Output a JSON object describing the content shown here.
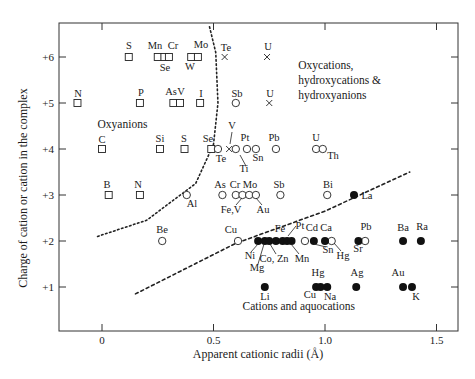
{
  "chart_data": {
    "type": "scatter",
    "title": "",
    "xlabel": "Apparent cationic radii (Å)",
    "ylabel": "Charge of cation or cation in the complex",
    "xlim": [
      -0.18,
      1.6
    ],
    "ylim": [
      0.25,
      6.7
    ],
    "x_ticks": [
      0,
      0.5,
      1.0,
      1.5
    ],
    "x_tick_labels": [
      "0",
      "0.5",
      "1.0",
      "1.5"
    ],
    "y_ticks": [
      1,
      2,
      3,
      4,
      5,
      6
    ],
    "y_tick_labels": [
      "+1",
      "+2",
      "+3",
      "+4",
      "+5",
      "+6"
    ],
    "grid": false,
    "legend": null,
    "marker_legend": {
      "square": "oxyanion",
      "cross": "oxycation",
      "open_circle": "hydroxy complex",
      "filled_circle": "cation / aquocation"
    },
    "region_labels": [
      {
        "text": "Oxyanions",
        "x": -0.02,
        "y": 4.45
      },
      {
        "text": "Oxycations,",
        "x": 0.88,
        "y": 5.75
      },
      {
        "text": "hydroxycations &",
        "x": 0.88,
        "y": 5.42
      },
      {
        "text": "hydroxyanions",
        "x": 0.88,
        "y": 5.09
      },
      {
        "text": "Cations and aquocations",
        "x": 0.63,
        "y": 0.5
      }
    ],
    "boundaries": [
      {
        "name": "oxyanion-boundary",
        "style": "dotted",
        "points": [
          [
            -0.02,
            2.1
          ],
          [
            0.2,
            2.45
          ],
          [
            0.42,
            3.25
          ],
          [
            0.5,
            4.1
          ],
          [
            0.52,
            5.0
          ],
          [
            0.51,
            6.1
          ],
          [
            0.48,
            6.7
          ]
        ]
      },
      {
        "name": "cation-boundary",
        "style": "dashed",
        "points": [
          [
            0.15,
            0.85
          ],
          [
            0.6,
            1.95
          ],
          [
            1.0,
            2.65
          ],
          [
            1.38,
            3.5
          ]
        ]
      }
    ],
    "series": [
      {
        "name": "Oxyanions",
        "marker": "square",
        "points": [
          {
            "label": "S",
            "x": 0.12,
            "y": 6
          },
          {
            "label": "Mn",
            "x": 0.25,
            "y": 6
          },
          {
            "label": "Se",
            "x": 0.28,
            "y": 6
          },
          {
            "label": "Cr",
            "x": 0.3,
            "y": 6
          },
          {
            "label": "W",
            "x": 0.4,
            "y": 6
          },
          {
            "label": "Mo",
            "x": 0.43,
            "y": 6
          },
          {
            "label": "N",
            "x": -0.11,
            "y": 5
          },
          {
            "label": "P",
            "x": 0.17,
            "y": 5
          },
          {
            "label": "As",
            "x": 0.32,
            "y": 5
          },
          {
            "label": "V",
            "x": 0.35,
            "y": 5
          },
          {
            "label": "I",
            "x": 0.44,
            "y": 5
          },
          {
            "label": "C",
            "x": 0.0,
            "y": 4
          },
          {
            "label": "Si",
            "x": 0.26,
            "y": 4
          },
          {
            "label": "S",
            "x": 0.37,
            "y": 4
          },
          {
            "label": "Se",
            "x": 0.49,
            "y": 4
          },
          {
            "label": "B",
            "x": 0.03,
            "y": 3
          },
          {
            "label": "N",
            "x": 0.17,
            "y": 3
          }
        ]
      },
      {
        "name": "Oxycations",
        "marker": "cross",
        "points": [
          {
            "label": "Te",
            "x": 0.55,
            "y": 6
          },
          {
            "label": "U",
            "x": 0.74,
            "y": 6
          },
          {
            "label": "U",
            "x": 0.75,
            "y": 5
          },
          {
            "label": "V",
            "x": 0.57,
            "y": 4
          }
        ]
      },
      {
        "name": "Hydroxy complexes",
        "marker": "open_circle",
        "points": [
          {
            "label": "Sb",
            "x": 0.6,
            "y": 5
          },
          {
            "label": "Te",
            "x": 0.52,
            "y": 4
          },
          {
            "label": "Ti",
            "x": 0.6,
            "y": 4
          },
          {
            "label": "Pt",
            "x": 0.65,
            "y": 4
          },
          {
            "label": "Sn",
            "x": 0.69,
            "y": 4
          },
          {
            "label": "Pb",
            "x": 0.78,
            "y": 4
          },
          {
            "label": "U",
            "x": 0.96,
            "y": 4
          },
          {
            "label": "Th",
            "x": 0.99,
            "y": 4
          },
          {
            "label": "Al",
            "x": 0.38,
            "y": 3
          },
          {
            "label": "As",
            "x": 0.54,
            "y": 3
          },
          {
            "label": "Cr",
            "x": 0.6,
            "y": 3
          },
          {
            "label": "Fe,V",
            "x": 0.63,
            "y": 3
          },
          {
            "label": "Mo",
            "x": 0.66,
            "y": 3
          },
          {
            "label": "Au",
            "x": 0.69,
            "y": 3
          },
          {
            "label": "Sb",
            "x": 0.8,
            "y": 3
          },
          {
            "label": "Bi",
            "x": 1.01,
            "y": 3
          },
          {
            "label": "Be",
            "x": 0.27,
            "y": 2
          },
          {
            "label": "Cu",
            "x": 0.61,
            "y": 2
          },
          {
            "label": "Sn",
            "x": 0.91,
            "y": 2
          },
          {
            "label": "Hg",
            "x": 1.03,
            "y": 2
          },
          {
            "label": "Pb",
            "x": 1.18,
            "y": 2
          }
        ]
      },
      {
        "name": "Cations and aquocations",
        "marker": "filled_circle",
        "points": [
          {
            "label": "La",
            "x": 1.13,
            "y": 3
          },
          {
            "label": "Ni",
            "x": 0.7,
            "y": 2
          },
          {
            "label": "Mg",
            "x": 0.73,
            "y": 2
          },
          {
            "label": "Co",
            "x": 0.75,
            "y": 2
          },
          {
            "label": "",
            "x": 0.78,
            "y": 2
          },
          {
            "label": "Fe",
            "x": 0.81,
            "y": 2
          },
          {
            "label": "Zn",
            "x": 0.83,
            "y": 2
          },
          {
            "label": "Mn",
            "x": 0.85,
            "y": 2
          },
          {
            "label": "Cd",
            "x": 0.95,
            "y": 2
          },
          {
            "label": "Ca",
            "x": 1.0,
            "y": 2
          },
          {
            "label": "Sr",
            "x": 1.15,
            "y": 2
          },
          {
            "label": "Ba",
            "x": 1.35,
            "y": 2
          },
          {
            "label": "Ra",
            "x": 1.43,
            "y": 2
          },
          {
            "label": "Li",
            "x": 0.73,
            "y": 1
          },
          {
            "label": "Cu",
            "x": 0.96,
            "y": 1
          },
          {
            "label": "Hg",
            "x": 0.98,
            "y": 1
          },
          {
            "label": "Na",
            "x": 1.01,
            "y": 1
          },
          {
            "label": "Ag",
            "x": 1.14,
            "y": 1
          },
          {
            "label": "Au",
            "x": 1.35,
            "y": 1
          },
          {
            "label": "K",
            "x": 1.39,
            "y": 1
          }
        ]
      }
    ],
    "point_labels": [
      {
        "text": "S",
        "px": 129,
        "py": 49
      },
      {
        "text": "Mn",
        "px": 155,
        "py": 49
      },
      {
        "text": "Cr",
        "px": 173,
        "py": 49
      },
      {
        "text": "Se",
        "px": 165,
        "py": 71
      },
      {
        "text": "Mo",
        "px": 201,
        "py": 48
      },
      {
        "text": "W",
        "px": 190,
        "py": 70
      },
      {
        "text": "Te",
        "px": 226,
        "py": 51
      },
      {
        "text": "U",
        "px": 268,
        "py": 50
      },
      {
        "text": "N",
        "px": 78,
        "py": 97
      },
      {
        "text": "P",
        "px": 141,
        "py": 96
      },
      {
        "text": "As",
        "px": 171,
        "py": 95
      },
      {
        "text": "V",
        "px": 181,
        "py": 95
      },
      {
        "text": "I",
        "px": 201,
        "py": 97
      },
      {
        "text": "Sb",
        "px": 237,
        "py": 97
      },
      {
        "text": "U",
        "px": 270,
        "py": 97
      },
      {
        "text": "C",
        "px": 102,
        "py": 143
      },
      {
        "text": "Si",
        "px": 160,
        "py": 142
      },
      {
        "text": "S",
        "px": 184,
        "py": 142
      },
      {
        "text": "Se",
        "px": 208,
        "py": 142
      },
      {
        "text": "V",
        "px": 232,
        "py": 129
      },
      {
        "text": "Pt",
        "px": 245,
        "py": 141
      },
      {
        "text": "Pb",
        "px": 274,
        "py": 141
      },
      {
        "text": "U",
        "px": 316,
        "py": 141
      },
      {
        "text": "Te",
        "px": 221,
        "py": 162
      },
      {
        "text": "Sn",
        "px": 258,
        "py": 161
      },
      {
        "text": "Ti",
        "px": 244,
        "py": 172
      },
      {
        "text": "Th",
        "px": 333,
        "py": 159
      },
      {
        "text": "B",
        "px": 107,
        "py": 188
      },
      {
        "text": "N",
        "px": 138,
        "py": 188
      },
      {
        "text": "As",
        "px": 220,
        "py": 188
      },
      {
        "text": "Cr",
        "px": 235,
        "py": 188
      },
      {
        "text": "Mo",
        "px": 250,
        "py": 188
      },
      {
        "text": "Sb",
        "px": 279,
        "py": 188
      },
      {
        "text": "Bi",
        "px": 328,
        "py": 188
      },
      {
        "text": "Al",
        "px": 192,
        "py": 207
      },
      {
        "text": "Fe,V",
        "px": 231,
        "py": 213
      },
      {
        "text": "Au",
        "px": 263,
        "py": 213
      },
      {
        "text": "La",
        "px": 367,
        "py": 199
      },
      {
        "text": "Be",
        "px": 162,
        "py": 233
      },
      {
        "text": "Cu",
        "px": 231,
        "py": 233
      },
      {
        "text": "Fe",
        "px": 280,
        "py": 232
      },
      {
        "text": "Pt",
        "px": 300,
        "py": 229
      },
      {
        "text": "Cd",
        "px": 312,
        "py": 231
      },
      {
        "text": "Ca",
        "px": 326,
        "py": 231
      },
      {
        "text": "Pb",
        "px": 366,
        "py": 230
      },
      {
        "text": "Ba",
        "px": 403,
        "py": 231
      },
      {
        "text": "Ra",
        "px": 422,
        "py": 230
      },
      {
        "text": "Ni",
        "px": 250,
        "py": 259
      },
      {
        "text": "Mg",
        "px": 257,
        "py": 271
      },
      {
        "text": "Co, Zn",
        "px": 274,
        "py": 262
      },
      {
        "text": "Mn",
        "px": 302,
        "py": 262
      },
      {
        "text": "Sn",
        "px": 328,
        "py": 253
      },
      {
        "text": "Hg",
        "px": 343,
        "py": 259
      },
      {
        "text": "Sr",
        "px": 358,
        "py": 252
      },
      {
        "text": "Hg",
        "px": 318,
        "py": 276
      },
      {
        "text": "Ag",
        "px": 357,
        "py": 276
      },
      {
        "text": "Au",
        "px": 398,
        "py": 276
      },
      {
        "text": "Li",
        "px": 265,
        "py": 300
      },
      {
        "text": "Cu",
        "px": 310,
        "py": 298
      },
      {
        "text": "Na",
        "px": 330,
        "py": 300
      },
      {
        "text": "K",
        "px": 416,
        "py": 300
      }
    ]
  }
}
